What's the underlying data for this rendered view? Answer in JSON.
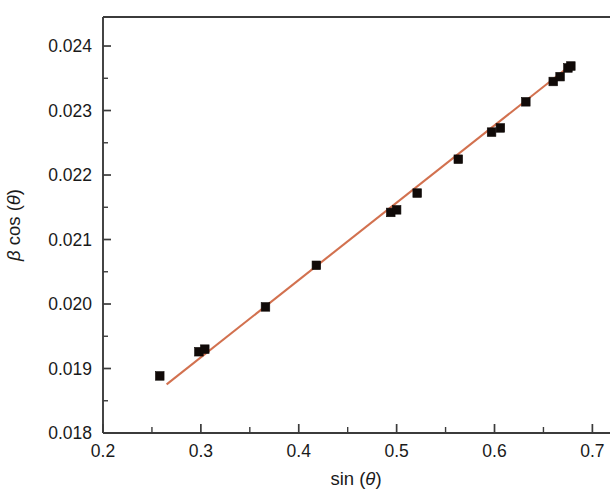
{
  "figure": {
    "background_color": "#ffffff",
    "frame_color": "#3b3b3b"
  },
  "chart_data": {
    "type": "scatter",
    "title": "",
    "subtitle": "",
    "xlabel": "sin (θ)",
    "ylabel": "β cos (θ)",
    "xlabel_parts": {
      "func": "sin (",
      "symbol": "θ",
      "close": ")"
    },
    "ylabel_parts": {
      "symbol1": "β",
      "func": " cos (",
      "symbol2": "θ",
      "close": ")"
    },
    "xlim": [
      0.2,
      0.718
    ],
    "ylim": [
      0.018,
      0.02445
    ],
    "xticks": [
      0.2,
      0.3,
      0.4,
      0.5,
      0.6,
      0.7
    ],
    "xticklabels": [
      "0.2",
      "0.3",
      "0.4",
      "0.5",
      "0.6",
      "0.7"
    ],
    "yticks": [
      0.018,
      0.019,
      0.02,
      0.021,
      0.022,
      0.023,
      0.024
    ],
    "yticklabels": [
      "0.018",
      "0.019",
      "0.020",
      "0.021",
      "0.022",
      "0.023",
      "0.024"
    ],
    "x_minor_ticks": [
      0.25,
      0.35,
      0.45,
      0.55,
      0.65
    ],
    "y_minor_ticks": [
      0.0185,
      0.0195,
      0.0205,
      0.0215,
      0.0225,
      0.0235
    ],
    "grid": false,
    "legend": null,
    "marker_style": "filled-square",
    "marker_color": "#100a08",
    "line_color": "#d2714f",
    "series": [
      {
        "name": "data",
        "marker": "square",
        "color": "#100a08",
        "points": [
          {
            "x": 0.258,
            "y": 0.018885
          },
          {
            "x": 0.298,
            "y": 0.01926
          },
          {
            "x": 0.304,
            "y": 0.0193
          },
          {
            "x": 0.366,
            "y": 0.019955
          },
          {
            "x": 0.418,
            "y": 0.0206
          },
          {
            "x": 0.494,
            "y": 0.02142
          },
          {
            "x": 0.5,
            "y": 0.02146
          },
          {
            "x": 0.521,
            "y": 0.02172
          },
          {
            "x": 0.563,
            "y": 0.022245
          },
          {
            "x": 0.597,
            "y": 0.022665
          },
          {
            "x": 0.606,
            "y": 0.02273
          },
          {
            "x": 0.632,
            "y": 0.023135
          },
          {
            "x": 0.66,
            "y": 0.02345
          },
          {
            "x": 0.667,
            "y": 0.023525
          },
          {
            "x": 0.675,
            "y": 0.02366
          },
          {
            "x": 0.678,
            "y": 0.02369
          }
        ]
      }
    ],
    "fit_line": {
      "name": "linear fit",
      "color": "#d2714f",
      "x_start": 0.265,
      "y_start": 0.018755,
      "x_end": 0.681,
      "y_end": 0.02374
    }
  }
}
